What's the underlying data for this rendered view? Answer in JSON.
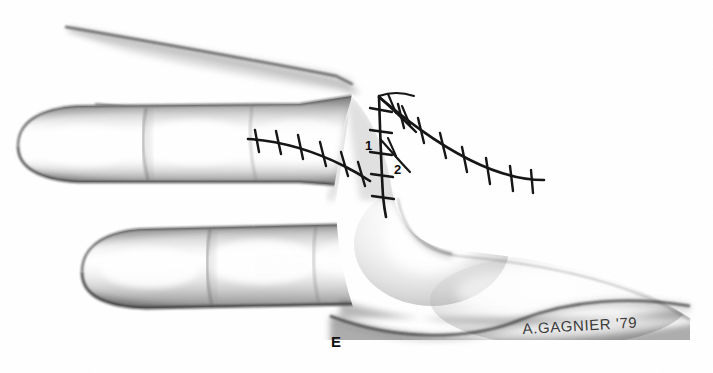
{
  "figure": {
    "kind": "pencil-illustration",
    "panel_label": "E",
    "background_color": "#ffffff",
    "ink_color": "#111111",
    "pencil_color": "#8c8c8c"
  },
  "annotations": {
    "flap_1": "1",
    "flap_2": "2"
  },
  "signature": {
    "text": "A.GAGNIER '79"
  },
  "alt": {
    "description": "Pencil drawing of a hand seen from the radial side showing a completed Z-plasty of the first web space. Two fingers extend to the left, the thumb and thenar eminence fill the lower right. Sutured incision lines with cross stitches run across the web space and out onto the dorsum of the hand; the two transposed triangular flaps are labelled 1 and 2."
  }
}
